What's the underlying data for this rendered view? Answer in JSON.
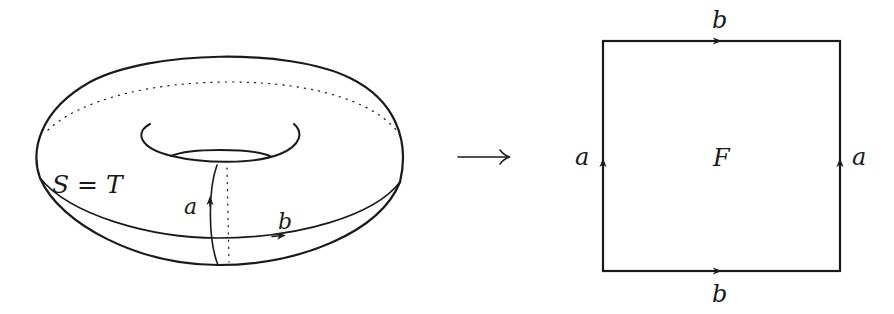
{
  "figure": {
    "torus": {
      "label": "S = T",
      "curve_a_label": "a",
      "curve_b_label": "b"
    },
    "map_arrow": "⟶",
    "square": {
      "face_label": "F",
      "top_edge_label": "b",
      "bottom_edge_label": "b",
      "left_edge_label": "a",
      "right_edge_label": "a"
    },
    "colors": {
      "stroke": "#1a1a1a",
      "background": "#ffffff"
    }
  }
}
